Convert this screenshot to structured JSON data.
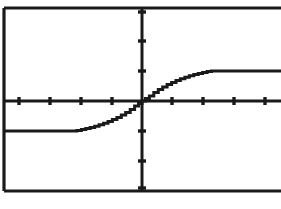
{
  "screen": {
    "name": "graphing-calculator-screen",
    "background_color": "#ffffff",
    "ink_color": "#1a1a1a"
  },
  "chart_data": {
    "type": "line",
    "title": "",
    "subtitle": "",
    "xlabel": "",
    "ylabel": "",
    "grid": false,
    "legend_position": "none",
    "axes": {
      "x_axis_visible": true,
      "y_axis_visible": true,
      "x_axis_y_value": 0,
      "y_axis_x_value": 0,
      "xlim": [
        -4.7,
        4.7
      ],
      "ylim": [
        -3.1,
        3.1
      ],
      "x_tick_interval": 1,
      "y_tick_interval": 1,
      "x_tick_values": [
        -4,
        -3,
        -2,
        -1,
        1,
        2,
        3,
        4
      ],
      "y_tick_values": [
        -3,
        -2,
        -1,
        1,
        2,
        3
      ],
      "x_tick_count_left": 4,
      "x_tick_count_right": 4,
      "y_tick_count_above": 3,
      "y_tick_count_below": 3,
      "tick_labels_shown": false
    },
    "series": [
      {
        "name": "sigmoid-step-curve",
        "description": "monotonic increasing S-shaped curve, flat at -1 for x below about -2.2, rising through origin, flat at +1 for x above about +2.2",
        "style": "stepped-pixel-line",
        "lower_plateau_y": -1,
        "upper_plateau_y": 1,
        "inflection_point": [
          0,
          0
        ],
        "x": [
          -4.7,
          -4.2,
          -3.8,
          -3.4,
          -3.0,
          -2.6,
          -2.35,
          -2.2,
          -2.05,
          -1.9,
          -1.75,
          -1.6,
          -1.45,
          -1.3,
          -1.15,
          -1.0,
          -0.85,
          -0.7,
          -0.55,
          -0.4,
          -0.25,
          -0.12,
          0,
          0.12,
          0.25,
          0.4,
          0.55,
          0.7,
          0.85,
          1.0,
          1.15,
          1.3,
          1.45,
          1.6,
          1.75,
          1.9,
          2.05,
          2.2,
          2.35,
          2.6,
          3.0,
          3.4,
          3.8,
          4.2,
          4.7
        ],
        "y": [
          -1.0,
          -1.0,
          -1.0,
          -1.0,
          -1.0,
          -1.0,
          -1.0,
          -0.98,
          -0.95,
          -0.92,
          -0.88,
          -0.84,
          -0.79,
          -0.74,
          -0.68,
          -0.62,
          -0.55,
          -0.47,
          -0.38,
          -0.28,
          -0.17,
          -0.08,
          0,
          0.08,
          0.17,
          0.28,
          0.38,
          0.47,
          0.55,
          0.62,
          0.68,
          0.74,
          0.79,
          0.84,
          0.88,
          0.92,
          0.95,
          0.98,
          1.0,
          1.0,
          1.0,
          1.0,
          1.0,
          1.0,
          1.0
        ]
      }
    ],
    "annotations": []
  },
  "frame": {
    "name": "plot-border",
    "left_border_visible": true,
    "top_border_visible": true,
    "bottom_border_visible": true,
    "right_border_visible": false
  }
}
